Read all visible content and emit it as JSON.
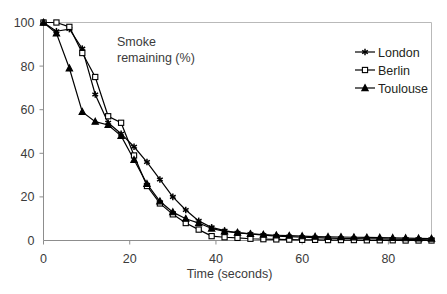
{
  "chart_data": {
    "type": "line",
    "title_lines": [
      "Smoke",
      "remaining (%)"
    ],
    "xlabel": "Time (seconds)",
    "ylabel": "",
    "xlim": [
      0,
      90
    ],
    "ylim": [
      0,
      100
    ],
    "xticks": [
      0,
      20,
      40,
      60,
      80
    ],
    "yticks": [
      0,
      20,
      40,
      60,
      80,
      100
    ],
    "xtick_labels": [
      "0",
      "20",
      "40",
      "60",
      "80"
    ],
    "ytick_labels": [
      "0",
      "20",
      "40",
      "60",
      "80",
      "100"
    ],
    "grid": false,
    "legend_position": "top-right",
    "x": [
      0,
      3,
      6,
      9,
      12,
      15,
      18,
      21,
      24,
      27,
      30,
      33,
      36,
      39,
      42,
      45,
      48,
      51,
      54,
      57,
      60,
      63,
      66,
      69,
      72,
      75,
      78,
      81,
      84,
      87,
      90
    ],
    "series": [
      {
        "name": "London",
        "marker": "star",
        "color": "#000000",
        "values": [
          100,
          96,
          97,
          88,
          67,
          54,
          49,
          43,
          36,
          28,
          20,
          14,
          9,
          6,
          4.5,
          3.5,
          3,
          2.5,
          2,
          1.8,
          1.5,
          1.3,
          1.1,
          1.0,
          0.9,
          0.8,
          0.7,
          0.6,
          0.5,
          0.4,
          0.3
        ]
      },
      {
        "name": "Berlin",
        "marker": "open-square",
        "color": "#000000",
        "values": [
          100,
          100,
          98,
          86,
          75,
          57,
          54,
          39,
          25,
          17,
          12,
          8,
          5,
          2,
          1.5,
          1.2,
          0.8,
          0.6,
          0.5,
          0.4,
          0.3,
          0.3,
          0.2,
          0.2,
          0.2,
          0.1,
          0.1,
          0.1,
          0.0,
          0.0,
          0.0
        ]
      },
      {
        "name": "Toulouse",
        "marker": "filled-triangle",
        "color": "#000000",
        "values": [
          100,
          95,
          79,
          59,
          54.5,
          53,
          48,
          37,
          26,
          18,
          13,
          10,
          8,
          5.5,
          4.2,
          3.6,
          3.0,
          2.7,
          2.4,
          2.2,
          2.0,
          1.8,
          1.7,
          1.6,
          1.5,
          1.4,
          1.3,
          1.2,
          1.1,
          1.0,
          0.9
        ]
      }
    ]
  },
  "legend": {
    "items": [
      {
        "label": "London",
        "marker": "star"
      },
      {
        "label": "Berlin",
        "marker": "open-square"
      },
      {
        "label": "Toulouse",
        "marker": "filled-triangle"
      }
    ]
  }
}
